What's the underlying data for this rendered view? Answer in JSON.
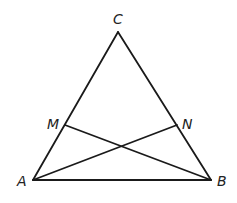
{
  "diagram": {
    "type": "triangle-with-cevians",
    "points": {
      "A": {
        "label": "A",
        "x": 33,
        "y": 180,
        "label_x": 17,
        "label_y": 186
      },
      "B": {
        "label": "B",
        "x": 211,
        "y": 180,
        "label_x": 217,
        "label_y": 186
      },
      "C": {
        "label": "C",
        "x": 118,
        "y": 32,
        "label_x": 113,
        "label_y": 24
      },
      "M": {
        "label": "M",
        "x": 65,
        "y": 125,
        "label_x": 47,
        "label_y": 129
      },
      "N": {
        "label": "N",
        "x": 177,
        "y": 125,
        "label_x": 182,
        "label_y": 129
      }
    },
    "segments": [
      {
        "name": "segment-AC",
        "from": "A",
        "to": "C"
      },
      {
        "name": "segment-BC",
        "from": "B",
        "to": "C"
      },
      {
        "name": "segment-AB",
        "from": "A",
        "to": "B"
      },
      {
        "name": "segment-MB",
        "from": "M",
        "to": "B"
      },
      {
        "name": "segment-AN",
        "from": "A",
        "to": "N"
      }
    ],
    "stroke_color": "#1a1a1a",
    "label_color": "#222222"
  }
}
